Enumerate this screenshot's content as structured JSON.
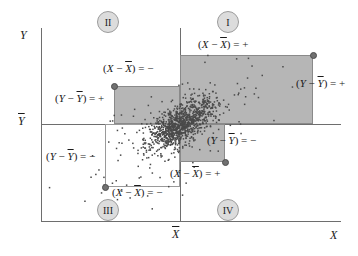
{
  "figure": {
    "kind": "scatter"
  },
  "axes": {
    "y_title": "Y",
    "x_title": "X",
    "y_mean_tick": "Ȳ",
    "x_mean_tick": "X̄",
    "axis_color": "#6e6e6e"
  },
  "quadrants": [
    {
      "id": "I",
      "label": "I"
    },
    {
      "id": "II",
      "label": "II"
    },
    {
      "id": "III",
      "label": "III"
    },
    {
      "id": "IV",
      "label": "IV"
    }
  ],
  "annotations": {
    "top_x_plus": {
      "open": "(",
      "var": "X",
      "op": " − ",
      "mean": "X",
      "close": ")",
      "eq": " = +"
    },
    "q2_x_minus": {
      "open": "(",
      "var": "X",
      "op": " − ",
      "mean": "X",
      "close": ")",
      "eq": " = −"
    },
    "q2_y_plus": {
      "open": "(",
      "var": "Y",
      "op": " − ",
      "mean": "Y",
      "close": ")",
      "eq": " = +"
    },
    "right_y_plus": {
      "open": "(",
      "var": "Y",
      "op": " − ",
      "mean": "Y",
      "close": ")",
      "eq": " = +"
    },
    "mid_y_minus": {
      "open": "(",
      "var": "Y",
      "op": " − ",
      "mean": "Y",
      "close": ")",
      "eq": " = −"
    },
    "left_y_minus": {
      "open": "(",
      "var": "Y",
      "op": " − ",
      "mean": "Y",
      "close": ")",
      "eq": " = −"
    },
    "bottom_x_plus": {
      "open": "(",
      "var": "X",
      "op": " − ",
      "mean": "X",
      "close": ")",
      "eq": " = +"
    },
    "q3_x_minus": {
      "open": "(",
      "var": "X",
      "op": " − ",
      "mean": "X",
      "close": ")",
      "eq": " = −"
    }
  },
  "colors": {
    "shade": "#b6b6b6",
    "rect_border": "#8a8a8a",
    "point": "#4a4a4a",
    "badge_fill": "#dcdcdc"
  },
  "chart_data": {
    "type": "scatter",
    "title": "",
    "xlabel": "X",
    "ylabel": "Y",
    "grid": false,
    "legend": null,
    "reference_lines": [
      {
        "name": "x-mean",
        "orientation": "vertical",
        "value_label": "X̄"
      },
      {
        "name": "y-mean",
        "orientation": "horizontal",
        "value_label": "Ȳ"
      }
    ],
    "quadrant_labels": [
      "I",
      "II",
      "III",
      "IV"
    ],
    "deviation_rectangles": [
      {
        "quadrant": "I",
        "shaded": true,
        "x_sign": "+",
        "y_sign": "+"
      },
      {
        "quadrant": "II",
        "shaded": true,
        "x_sign": "−",
        "y_sign": "+"
      },
      {
        "quadrant": "III",
        "shaded": false,
        "x_sign": "−",
        "y_sign": "−"
      },
      {
        "quadrant": "IV",
        "shaded": true,
        "x_sign": "+",
        "y_sign": "−"
      }
    ],
    "point_count_approx": 1200,
    "correlation_sign": "positive"
  }
}
